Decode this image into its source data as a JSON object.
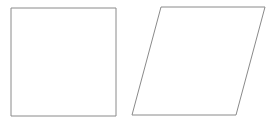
{
  "diagram": {
    "background": "#ffffff",
    "stroke_color": "#8a8a8a",
    "stroke_width": 1,
    "shapes": [
      {
        "name": "square",
        "type": "polygon",
        "points": "11,8 116,8 116,116 11,116"
      },
      {
        "name": "parallelogram",
        "type": "polygon",
        "points": "161,7 265,7 236,115 132,115"
      }
    ]
  }
}
